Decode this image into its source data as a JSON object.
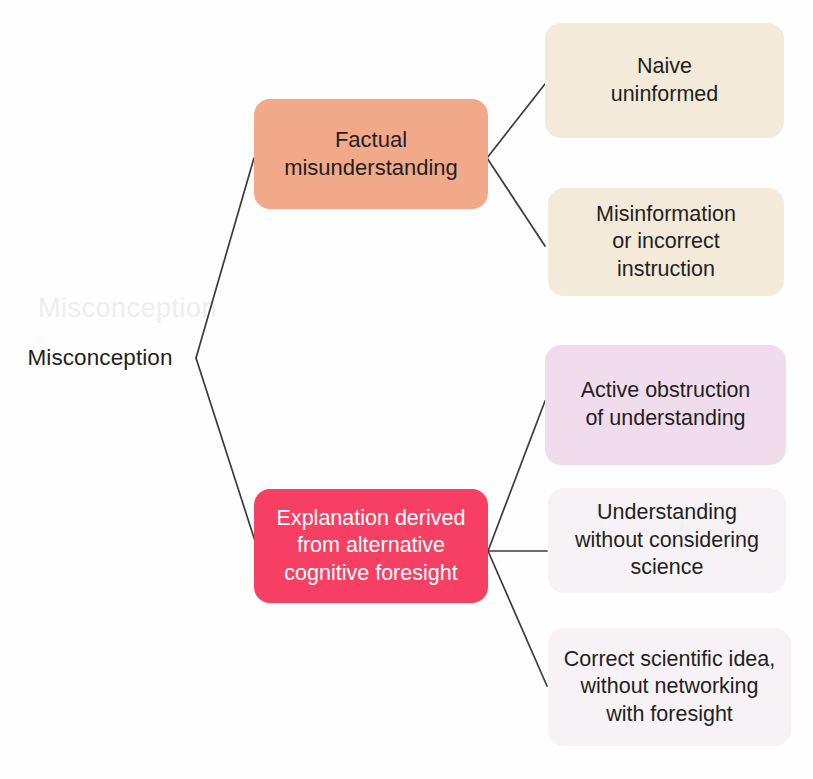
{
  "diagram": {
    "type": "hierarchy-tree",
    "orientation": "left-to-right",
    "root": {
      "label": "Misconception",
      "ghost_artifact": "Misconception"
    },
    "branches": [
      {
        "id": "factual-misunderstanding",
        "label": "Factual\nmisunderstanding",
        "color": "#f2a98a",
        "text_color": "#231f20",
        "children": [
          {
            "id": "naive-uninformed",
            "label": "Naive\nuninformed",
            "color": "#f4ead9",
            "text_color": "#231f20"
          },
          {
            "id": "misinformation-or-incorrect-instruction",
            "label": "Misinformation\nor incorrect\ninstruction",
            "color": "#f4ead9",
            "text_color": "#231f20"
          }
        ]
      },
      {
        "id": "explanation-derived-from-alternative-cognitive-foresight",
        "label": "Explanation derived\nfrom alternative\ncognitive foresight",
        "color": "#f73f63",
        "text_color": "#ffffff",
        "children": [
          {
            "id": "active-obstruction-of-understanding",
            "label": "Active obstruction\nof understanding",
            "color": "#f1dcee",
            "text_color": "#231f20"
          },
          {
            "id": "understanding-without-considering-science",
            "label": "Understanding\nwithout considering\nscience",
            "color": "#f7f2f6",
            "text_color": "#231f20"
          },
          {
            "id": "correct-scientific-idea-without-networking-with-foresight",
            "label": "Correct scientific idea,\nwithout networking\nwith foresight",
            "color": "#f7f2f6",
            "text_color": "#231f20"
          }
        ]
      }
    ],
    "connector_color": "#3b3b3f",
    "background_color": "#fefefe"
  }
}
